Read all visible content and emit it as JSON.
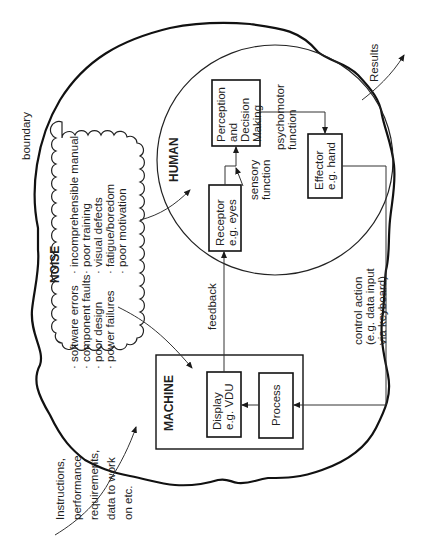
{
  "diagram": {
    "orientation": "rotated 90 degrees counter-clockwise",
    "boundary_label": "boundary",
    "input_label_lines": [
      "Instructions,",
      "performance",
      "requirements,",
      "data to work",
      "on etc."
    ],
    "output_label": "Results",
    "noise": {
      "title": "NOISE",
      "left_items": [
        "software errors",
        "component faults",
        "poor design",
        "power failures"
      ],
      "right_items": [
        "incomprehensible manual",
        "poor training",
        "visual defects",
        "fatigue/boredom",
        "poor motivation"
      ]
    },
    "machine": {
      "title": "MACHINE",
      "display_lines": [
        "Display",
        "e.g. VDU"
      ],
      "process": "Process"
    },
    "human": {
      "title": "HUMAN",
      "receptor_lines": [
        "Receptor",
        "e.g. eyes"
      ],
      "perception_lines": [
        "Perception",
        "and",
        "Decision",
        "Making"
      ],
      "effector_lines": [
        "Effector",
        "e.g. hand"
      ],
      "sensory_lines": [
        "sensory",
        "function"
      ],
      "psychomotor_lines": [
        "psychomotor",
        "function"
      ]
    },
    "feedback_label": "feedback",
    "control_action_lines": [
      "control action",
      "(e.g. data input",
      "via keyboard)"
    ]
  }
}
